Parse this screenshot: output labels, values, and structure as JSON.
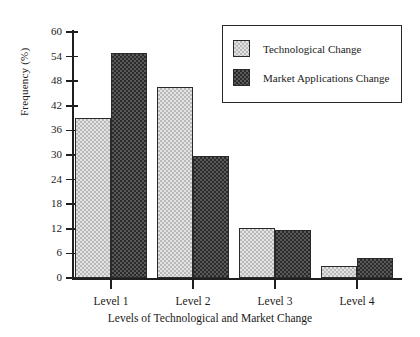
{
  "chart_data": {
    "type": "bar",
    "title": "",
    "xlabel": "Levels of Technological and Market Change",
    "ylabel": "Frequency (%)",
    "categories": [
      "Level 1",
      "Level 2",
      "Level 3",
      "Level 4"
    ],
    "series": [
      {
        "name": "Technological Change",
        "values": [
          39,
          46.5,
          12.3,
          3
        ],
        "pattern": "light-dotted",
        "color": "#e3e3e3"
      },
      {
        "name": "Market Applications Change",
        "values": [
          55,
          29.7,
          11.7,
          4.8
        ],
        "pattern": "dark-hatch",
        "color": "#5a5a5a"
      }
    ],
    "ylim": [
      0,
      60
    ],
    "yticks": [
      0,
      6,
      12,
      18,
      24,
      30,
      36,
      42,
      48,
      54,
      60
    ],
    "ytick_labels": [
      "0",
      "6",
      "12",
      "18",
      "24",
      "30",
      "36",
      "42",
      "48",
      "54",
      "60"
    ],
    "grid": false,
    "legend_position": "top-right"
  },
  "legend": {
    "entries": [
      {
        "label": "Technological Change"
      },
      {
        "label": "Market Applications Change"
      }
    ]
  },
  "axes": {
    "y_title": "Frequency (%)",
    "x_title": "Levels of Technological and Market Change"
  }
}
